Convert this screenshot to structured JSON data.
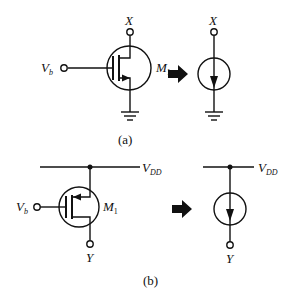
{
  "header": {
    "cut_text": "……DD……"
  },
  "circuit_a": {
    "caption": "(a)",
    "terminal_top": "X",
    "gate_label": "V",
    "gate_sub": "b",
    "transistor_label": "M",
    "transistor_sub": "1",
    "equivalent_terminal": "X",
    "type": "NMOS current source to ground"
  },
  "circuit_b": {
    "caption": "(b)",
    "supply_label": "V",
    "supply_sub": "DD",
    "gate_label": "V",
    "gate_sub": "b",
    "transistor_label": "M",
    "transistor_sub": "1",
    "terminal_bottom": "Y",
    "equivalent_supply_label": "V",
    "equivalent_supply_sub": "DD",
    "equivalent_terminal": "Y",
    "type": "PMOS current source from VDD"
  },
  "colors": {
    "stroke": "#111111",
    "background": "#ffffff"
  }
}
